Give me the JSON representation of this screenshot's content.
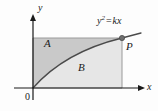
{
  "figure": {
    "type": "math-diagram",
    "labels": {
      "region_a": "A",
      "region_b": "B",
      "point_p": "P",
      "y_axis": "y",
      "x_axis": "x",
      "origin": "0",
      "equation_base": "y",
      "equation_exponent": "2",
      "equation_operator": "=",
      "equation_right": "kx"
    },
    "colors": {
      "region_a_fill": "#c9c9c9",
      "region_b_fill": "#e6e6e6",
      "curve": "#4a4a4a",
      "axis": "#1a1a1a",
      "rect_border": "#8c8c8c",
      "point_fill": "#6e6e6e",
      "background": "#fdfdfd"
    },
    "geometry": {
      "origin_px": [
        33,
        88
      ],
      "rect_left_px": 33,
      "rect_top_px": 38,
      "rect_right_px": 122,
      "rect_bottom_px": 88,
      "point_p_px": [
        122,
        38
      ],
      "curve": "y = sqrt(k x) from origin to point P"
    }
  }
}
